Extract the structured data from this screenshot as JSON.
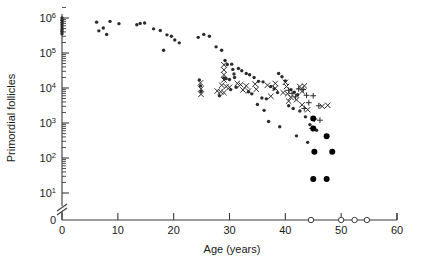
{
  "chart_data": {
    "type": "scatter",
    "title": "",
    "xlabel": "Age (years)",
    "ylabel": "Primordial follicles",
    "xlim": [
      0,
      60
    ],
    "ylim_log": [
      1,
      6
    ],
    "yscale": "log",
    "xticks": [
      0,
      10,
      20,
      30,
      40,
      50,
      60
    ],
    "xticklabels": [
      "0",
      "10",
      "20",
      "30",
      "40",
      "50",
      "60"
    ],
    "yticks_exponent": [
      1,
      2,
      3,
      4,
      5,
      6
    ],
    "yticklabels": [
      "10¹",
      "10²",
      "10³",
      "10⁴",
      "10⁵",
      "10⁶"
    ],
    "y_zero_label": "0",
    "axis_break": true,
    "grid": false,
    "legend": "none",
    "minor_ticks": "log decades, 2-9 per decade",
    "series": [
      {
        "name": "dot",
        "marker": "small-filled-dot",
        "color": "#2b2b2b",
        "points": [
          [
            0.0,
            1000000
          ],
          [
            0.0,
            860000
          ],
          [
            0.0,
            740000
          ],
          [
            0.0,
            640000
          ],
          [
            0.0,
            550000
          ],
          [
            0.0,
            470000
          ],
          [
            0.0,
            410000
          ],
          [
            0.0,
            355000
          ],
          [
            6.2,
            760000
          ],
          [
            6.6,
            430000
          ],
          [
            7.4,
            520000
          ],
          [
            8.0,
            340000
          ],
          [
            8.6,
            800000
          ],
          [
            10.2,
            690000
          ],
          [
            13.4,
            640000
          ],
          [
            14.0,
            700000
          ],
          [
            14.8,
            720000
          ],
          [
            16.4,
            490000
          ],
          [
            17.6,
            440000
          ],
          [
            18.8,
            330000
          ],
          [
            19.6,
            300000
          ],
          [
            20.2,
            235000
          ],
          [
            21.0,
            195000
          ],
          [
            18.2,
            120000
          ],
          [
            24.4,
            280000
          ],
          [
            25.4,
            340000
          ],
          [
            26.4,
            300000
          ],
          [
            27.6,
            150000
          ],
          [
            24.6,
            17000
          ],
          [
            24.8,
            11500
          ],
          [
            24.9,
            8000
          ],
          [
            28.6,
            120000
          ],
          [
            29.2,
            61000
          ],
          [
            29.6,
            47000
          ],
          [
            30.4,
            48000
          ],
          [
            30.6,
            34000
          ],
          [
            30.8,
            25000
          ],
          [
            30.9,
            20000
          ],
          [
            31.6,
            36000
          ],
          [
            32.2,
            31000
          ],
          [
            33.0,
            26000
          ],
          [
            33.6,
            24000
          ],
          [
            29.0,
            19500
          ],
          [
            29.4,
            18500
          ],
          [
            30.0,
            17500
          ],
          [
            31.2,
            10500
          ],
          [
            30.2,
            9000
          ],
          [
            28.2,
            6000
          ],
          [
            34.4,
            20000
          ],
          [
            35.2,
            15500
          ],
          [
            36.0,
            15000
          ],
          [
            33.4,
            7800
          ],
          [
            34.0,
            6800
          ],
          [
            35.8,
            5200
          ],
          [
            36.6,
            4900
          ],
          [
            37.4,
            11000
          ],
          [
            38.0,
            9500
          ],
          [
            38.6,
            7400
          ],
          [
            35.0,
            3400
          ],
          [
            36.2,
            2300
          ],
          [
            38.8,
            26000
          ],
          [
            39.4,
            21000
          ],
          [
            40.0,
            16000
          ],
          [
            37.0,
            1100
          ],
          [
            39.0,
            780
          ],
          [
            41.0,
            9000
          ],
          [
            41.6,
            7600
          ],
          [
            42.2,
            6400
          ],
          [
            40.6,
            3100
          ],
          [
            41.4,
            2600
          ],
          [
            42.6,
            2200
          ],
          [
            43.6,
            1500
          ],
          [
            44.4,
            900
          ],
          [
            45.6,
            620
          ],
          [
            42.0,
            430
          ],
          [
            44.0,
            280
          ]
        ]
      },
      {
        "name": "x-marker",
        "marker": "x",
        "color": "#2b2b2b",
        "points": [
          [
            24.8,
            14000
          ],
          [
            24.9,
            9500
          ],
          [
            24.9,
            6600
          ],
          [
            29.0,
            46000
          ],
          [
            29.0,
            33000
          ],
          [
            29.0,
            24000
          ],
          [
            29.0,
            17000
          ],
          [
            28.6,
            12000
          ],
          [
            29.4,
            11000
          ],
          [
            30.0,
            10500
          ],
          [
            27.8,
            8200
          ],
          [
            28.4,
            7800
          ],
          [
            29.0,
            7400
          ],
          [
            31.4,
            13500
          ],
          [
            32.0,
            12500
          ],
          [
            33.0,
            11500
          ],
          [
            32.4,
            8800
          ],
          [
            33.4,
            8200
          ],
          [
            34.6,
            13000
          ],
          [
            34.8,
            9200
          ],
          [
            36.8,
            12000
          ],
          [
            38.2,
            13500
          ],
          [
            38.2,
            9800
          ],
          [
            37.4,
            5800
          ],
          [
            40.0,
            14500
          ],
          [
            40.2,
            11000
          ],
          [
            39.6,
            7400
          ],
          [
            40.4,
            6800
          ],
          [
            41.0,
            5400
          ],
          [
            40.6,
            4200
          ],
          [
            42.6,
            11000
          ],
          [
            43.4,
            11500
          ],
          [
            43.0,
            8000
          ],
          [
            42.0,
            4600
          ],
          [
            43.0,
            3300
          ],
          [
            46.6,
            3000
          ],
          [
            47.6,
            3200
          ],
          [
            44.0,
            2400
          ]
        ]
      },
      {
        "name": "plus-marker",
        "marker": "plus",
        "color": "#2b2b2b",
        "points": [
          [
            40.6,
            8600
          ],
          [
            41.2,
            7000
          ],
          [
            41.8,
            5600
          ],
          [
            42.4,
            9400
          ],
          [
            43.2,
            9000
          ],
          [
            43.8,
            6200
          ],
          [
            45.0,
            6000
          ],
          [
            44.2,
            3800
          ],
          [
            43.4,
            2600
          ],
          [
            46.0,
            3100
          ],
          [
            45.2,
            1300
          ],
          [
            46.2,
            1200
          ],
          [
            44.8,
            700
          ]
        ]
      },
      {
        "name": "filled-circle",
        "marker": "large-filled-circle",
        "color": "#000000",
        "points": [
          [
            45.0,
            1350
          ],
          [
            45.0,
            700
          ],
          [
            47.4,
            420
          ],
          [
            45.2,
            150
          ],
          [
            48.4,
            150
          ],
          [
            45.0,
            25
          ],
          [
            47.4,
            25
          ]
        ]
      },
      {
        "name": "open-circle",
        "marker": "open-circle",
        "color": "#3a3a3a",
        "points_at_zero": [
          44.6,
          50.0,
          52.4,
          54.6
        ]
      }
    ]
  }
}
